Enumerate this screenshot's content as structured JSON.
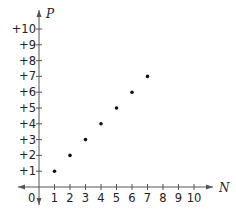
{
  "chart_data": {
    "type": "scatter",
    "title": "",
    "xlabel": "N",
    "ylabel": "P",
    "x": [
      1,
      2,
      3,
      4,
      5,
      6,
      7
    ],
    "y": [
      1,
      2,
      3,
      4,
      5,
      6,
      7
    ],
    "series": [
      {
        "name": "",
        "x": [
          1,
          2,
          3,
          4,
          5,
          6,
          7
        ],
        "values": [
          1,
          2,
          3,
          4,
          5,
          6,
          7
        ]
      }
    ],
    "xticks": [
      "1",
      "2",
      "3",
      "4",
      "5",
      "6",
      "7",
      "8",
      "9",
      "10"
    ],
    "yticks": [
      "+1",
      "+2",
      "+3",
      "+4",
      "+5",
      "+6",
      "+7",
      "+8",
      "+9",
      "+10"
    ],
    "origin_label": "0",
    "xlim": [
      0,
      10.5
    ],
    "ylim": [
      0,
      10.5
    ],
    "grid": false,
    "legend": null,
    "colors": {
      "axis": "#555555",
      "point": "#111111",
      "text": "#222222"
    }
  }
}
